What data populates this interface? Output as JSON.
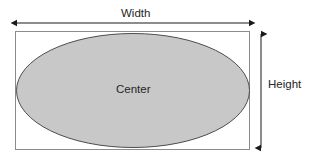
{
  "diagram": {
    "labels": {
      "width": "Width",
      "height": "Height",
      "center": "Center"
    },
    "colors": {
      "ellipse_fill": "#c8c8c8",
      "ellipse_stroke": "#4d4d4d",
      "rect_stroke": "#8c8c8c",
      "arrow": "#1a1a1a",
      "text": "#262626",
      "background": "#ffffff"
    },
    "shapes": {
      "bounding_box": {
        "x": 15,
        "y": 31,
        "width": 235,
        "height": 119
      },
      "ellipse": {
        "cx": 133,
        "cy": 90.5,
        "rx": 117,
        "ry": 57
      }
    },
    "dimension_arrows": {
      "width_arrow": {
        "x1": 16,
        "y1": 23,
        "x2": 250,
        "y2": 23,
        "orientation": "horizontal",
        "double_headed": true
      },
      "height_arrow": {
        "x1": 261,
        "y1": 33,
        "x2": 261,
        "y2": 149,
        "orientation": "vertical",
        "double_headed": true
      }
    }
  }
}
